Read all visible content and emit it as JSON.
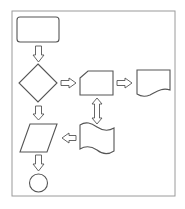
{
  "diagram": {
    "type": "flowchart",
    "colors": {
      "stroke": "#555555",
      "frame": "#9a9a9a",
      "background": "#ffffff"
    },
    "nodes": [
      {
        "id": "start",
        "shape": "rounded-rectangle",
        "label": ""
      },
      {
        "id": "decision",
        "shape": "diamond",
        "label": ""
      },
      {
        "id": "manual-input",
        "shape": "manual-input",
        "label": ""
      },
      {
        "id": "document",
        "shape": "document",
        "label": ""
      },
      {
        "id": "punched-tape",
        "shape": "punched-tape",
        "label": ""
      },
      {
        "id": "data",
        "shape": "parallelogram",
        "label": ""
      },
      {
        "id": "connector",
        "shape": "circle",
        "label": ""
      }
    ],
    "edges": [
      {
        "from": "start",
        "to": "decision",
        "style": "block-arrow-down"
      },
      {
        "from": "decision",
        "to": "manual-input",
        "style": "block-arrow-right"
      },
      {
        "from": "manual-input",
        "to": "document",
        "style": "block-arrow-right"
      },
      {
        "from": "manual-input",
        "to": "punched-tape",
        "style": "block-arrow-bidirectional-vertical"
      },
      {
        "from": "punched-tape",
        "to": "data",
        "style": "block-arrow-left"
      },
      {
        "from": "decision",
        "to": "data",
        "style": "block-arrow-down"
      },
      {
        "from": "data",
        "to": "connector",
        "style": "block-arrow-down"
      }
    ]
  }
}
